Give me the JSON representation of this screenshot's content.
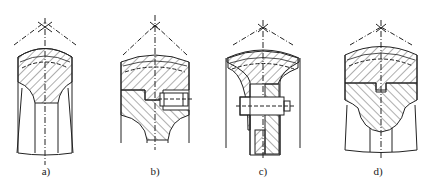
{
  "figure": {
    "panels": [
      {
        "id": "a",
        "label": "a)",
        "cx": 45,
        "label_x": 46
      },
      {
        "id": "b",
        "label": "b)",
        "cx": 155,
        "label_x": 155
      },
      {
        "id": "c",
        "label": "c)",
        "cx": 263,
        "label_x": 263
      },
      {
        "id": "d",
        "label": "d)",
        "cx": 381,
        "label_x": 378
      }
    ],
    "colors": {
      "line": "#222222",
      "background": "#ffffff"
    }
  }
}
